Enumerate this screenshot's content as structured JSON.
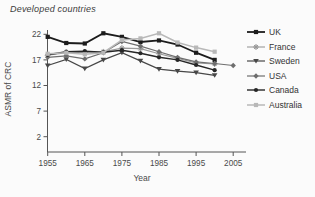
{
  "figure": {
    "title": "Developed countries",
    "xlabel": "Year",
    "ylabel": "ASMR of CRC"
  },
  "chart_data": {
    "type": "line",
    "title": "Developed countries",
    "xlabel": "Year",
    "ylabel": "ASMR of CRC",
    "x": [
      1955,
      1960,
      1965,
      1970,
      1975,
      1980,
      1985,
      1990,
      1995,
      2000
    ],
    "x_ticks": [
      1955,
      1965,
      1975,
      1985,
      1995,
      2005
    ],
    "y_ticks": [
      2,
      7,
      12,
      17,
      22
    ],
    "xlim": [
      1955,
      2008
    ],
    "ylim": [
      -1,
      23
    ],
    "grid": false,
    "legend_position": "right",
    "axis_color": "#555555",
    "series": [
      {
        "name": "UK",
        "color": "#1c1c1c",
        "marker": "square",
        "line_width": 1.8,
        "values": [
          21.5,
          20.3,
          20.2,
          22.2,
          21.5,
          20.5,
          20.8,
          20.0,
          18.4,
          17.0
        ]
      },
      {
        "name": "France",
        "color": "#9a9a9a",
        "marker": "star",
        "line_width": 1.1,
        "values": [
          17.9,
          18.4,
          18.5,
          18.6,
          19.3,
          19.2,
          18.2,
          17.3,
          16.4,
          16.2
        ]
      },
      {
        "name": "Sweden",
        "color": "#474747",
        "marker": "triangle-down",
        "line_width": 1.2,
        "values": [
          15.9,
          17.1,
          15.3,
          17.0,
          18.4,
          16.8,
          15.2,
          14.8,
          14.5,
          14.0
        ]
      },
      {
        "name": "USA",
        "color": "#6e6e6e",
        "marker": "diamond",
        "line_width": 1.2,
        "x": [
          1955,
          1960,
          1965,
          1970,
          1975,
          1980,
          1985,
          1990,
          1995,
          2000,
          2005
        ],
        "values": [
          17.5,
          17.8,
          17.2,
          18.4,
          20.6,
          19.7,
          18.6,
          17.5,
          16.6,
          16.3,
          15.9
        ]
      },
      {
        "name": "Canada",
        "color": "#262626",
        "marker": "circle",
        "line_width": 1.4,
        "values": [
          18.0,
          18.6,
          18.7,
          18.5,
          18.9,
          18.3,
          17.5,
          17.0,
          16.0,
          15.0
        ]
      },
      {
        "name": "Australia",
        "color": "#b8b8b8",
        "marker": "square",
        "line_width": 1.5,
        "values": [
          18.2,
          18.4,
          18.1,
          18.4,
          20.9,
          21.2,
          22.2,
          20.4,
          19.4,
          18.6
        ]
      }
    ]
  }
}
